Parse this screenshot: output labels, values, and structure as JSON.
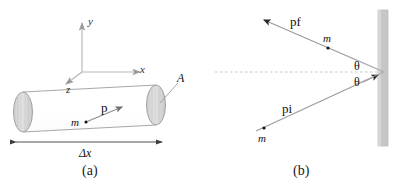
{
  "figure": {
    "panels": [
      {
        "id": "a",
        "caption": "(a)",
        "description": "cylinder-with-momentum-vector",
        "axes": {
          "y_label": "y",
          "x_label": "x",
          "z_label": "z"
        },
        "labels": {
          "area": "A",
          "mass": "m",
          "momentum": "p",
          "length": "Δx"
        },
        "colors": {
          "cylinder_fill": "#ffffff",
          "cylinder_stroke": "#8a8a8a",
          "disk_fill": "#d8d8d8",
          "disk_stroke": "#9a9a9a",
          "axis_stroke": "#b5b5b5",
          "vector_stroke": "#7d7d7d",
          "dimension_stroke": "#4a4a4a"
        }
      },
      {
        "id": "b",
        "caption": "(b)",
        "description": "particle-reflecting-off-wall",
        "labels": {
          "momentum_final": "p",
          "momentum_final_sub": "f",
          "momentum_initial": "p",
          "momentum_initial_sub": "i",
          "mass_upper": "m",
          "mass_lower": "m",
          "angle_upper": "θ",
          "angle_lower": "θ"
        },
        "colors": {
          "wall_fill": "#c6c6c6",
          "wall_stroke": "#b0b0b0",
          "ray_stroke": "#9a9a9a",
          "normal_dash": "#c0c0c0",
          "angle_line": "#b8b8b8",
          "dot_fill": "#111111"
        }
      }
    ]
  }
}
